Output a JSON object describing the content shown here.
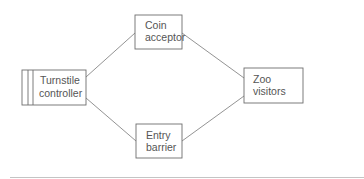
{
  "diagram": {
    "type": "context-diagram",
    "nodes": [
      {
        "id": "turnstile",
        "label_lines": [
          "Turnstile",
          "controller"
        ],
        "kind": "system"
      },
      {
        "id": "coin",
        "label_lines": [
          "Coin",
          "acceptor"
        ],
        "kind": "external"
      },
      {
        "id": "barrier",
        "label_lines": [
          "Entry",
          "barrier"
        ],
        "kind": "external"
      },
      {
        "id": "visitors",
        "label_lines": [
          "Zoo",
          "visitors"
        ],
        "kind": "external"
      }
    ],
    "edges": [
      {
        "from": "turnstile",
        "to": "coin"
      },
      {
        "from": "turnstile",
        "to": "barrier"
      },
      {
        "from": "coin",
        "to": "visitors"
      },
      {
        "from": "barrier",
        "to": "visitors"
      }
    ],
    "colors": {
      "stroke": "#6e6e6e",
      "text": "#555555",
      "rule": "#bdbdbd"
    }
  }
}
